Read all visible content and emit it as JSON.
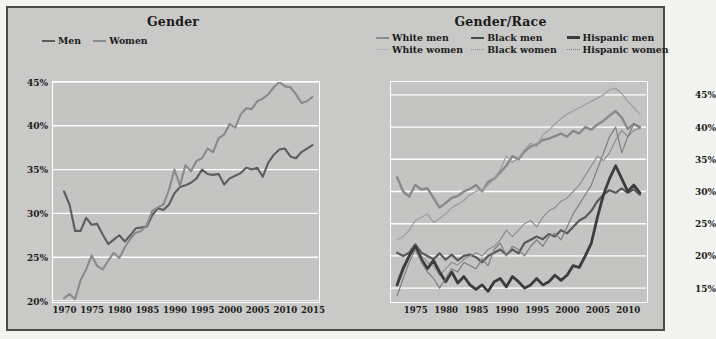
{
  "figure": {
    "background_color": "#c9c9c7",
    "border_color": "#4a4a48",
    "plot_background_color": "#c4c4c2",
    "gridline_color": "#ffffff"
  },
  "panels": [
    {
      "id": "gender",
      "title": "Gender",
      "legend": [
        {
          "label": "Men",
          "style": "solid",
          "color": "#5d5d5d"
        },
        {
          "label": "Women",
          "style": "solid",
          "color": "#8a8a8a"
        }
      ],
      "yticks": [
        "20%",
        "25%",
        "30%",
        "35%",
        "40%",
        "45%"
      ],
      "xticks": [
        "1970",
        "1975",
        "1980",
        "1985",
        "1990",
        "1995",
        "2000",
        "2005",
        "2010",
        "2015"
      ]
    },
    {
      "id": "genderrace",
      "title": "Gender/Race",
      "legend": [
        {
          "label": "White men",
          "style": "solid",
          "color": "#8a8a8a"
        },
        {
          "label": "Black men",
          "style": "solid",
          "color": "#5a5a5a"
        },
        {
          "label": "Hispanic men",
          "style": "solid",
          "color": "#3c3c3c"
        },
        {
          "label": "White women",
          "style": "dotted",
          "color": "#9c9c9c"
        },
        {
          "label": "Black women",
          "style": "dotted",
          "color": "#8f8f8f"
        },
        {
          "label": "Hispanic women",
          "style": "dotted",
          "color": "#7e7e7e"
        }
      ],
      "yticks": [
        "15%",
        "20%",
        "25%",
        "30%",
        "35%",
        "40%",
        "45%"
      ],
      "xticks": [
        "1975",
        "1980",
        "1985",
        "1990",
        "1995",
        "2000",
        "2005",
        "2010"
      ]
    }
  ],
  "chart_data": [
    {
      "type": "line",
      "title": "Gender",
      "xlabel": "",
      "ylabel": "",
      "xlim": [
        1968,
        2016
      ],
      "ylim": [
        20,
        45
      ],
      "grid": true,
      "legend_position": "top-left",
      "x": [
        1970,
        1971,
        1972,
        1973,
        1974,
        1975,
        1976,
        1977,
        1978,
        1979,
        1980,
        1981,
        1982,
        1983,
        1984,
        1985,
        1986,
        1987,
        1988,
        1989,
        1990,
        1991,
        1992,
        1993,
        1994,
        1995,
        1996,
        1997,
        1998,
        1999,
        2000,
        2001,
        2002,
        2003,
        2004,
        2005,
        2006,
        2007,
        2008,
        2009,
        2010,
        2011,
        2012,
        2013,
        2014,
        2015
      ],
      "series": [
        {
          "name": "Men",
          "style": "solid",
          "color": "#5d5d5d",
          "values": [
            32.5,
            31.0,
            28.0,
            28.0,
            29.5,
            28.7,
            28.8,
            27.6,
            26.5,
            27.0,
            27.5,
            26.8,
            27.5,
            28.3,
            28.4,
            28.5,
            29.8,
            30.6,
            30.4,
            31.0,
            32.3,
            33.0,
            33.2,
            33.5,
            34.0,
            35.0,
            34.5,
            34.4,
            34.5,
            33.3,
            34.0,
            34.3,
            34.6,
            35.2,
            35.0,
            35.2,
            34.2,
            35.8,
            36.7,
            37.3,
            37.4,
            36.5,
            36.3,
            37.0,
            37.4,
            37.8
          ]
        },
        {
          "name": "Women",
          "style": "solid",
          "color": "#8a8a8a",
          "values": [
            20.3,
            20.8,
            20.2,
            22.4,
            23.6,
            25.2,
            24.0,
            23.6,
            24.6,
            25.5,
            24.9,
            26.1,
            27.1,
            27.8,
            28.0,
            28.7,
            30.3,
            30.7,
            31.0,
            32.7,
            35.0,
            33.2,
            35.5,
            34.8,
            36.0,
            36.3,
            37.4,
            37.0,
            38.6,
            39.0,
            40.2,
            39.8,
            41.3,
            42.0,
            41.9,
            42.8,
            43.1,
            43.6,
            44.4,
            45.0,
            44.5,
            44.4,
            43.6,
            42.6,
            42.8,
            43.3
          ]
        }
      ]
    },
    {
      "type": "line",
      "title": "Gender/Race",
      "xlabel": "",
      "ylabel": "",
      "xlim": [
        1971,
        2013
      ],
      "ylim": [
        13,
        47
      ],
      "grid": true,
      "legend_position": "top",
      "x": [
        1972,
        1973,
        1974,
        1975,
        1976,
        1977,
        1978,
        1979,
        1980,
        1981,
        1982,
        1983,
        1984,
        1985,
        1986,
        1987,
        1988,
        1989,
        1990,
        1991,
        1992,
        1993,
        1994,
        1995,
        1996,
        1997,
        1998,
        1999,
        2000,
        2001,
        2002,
        2003,
        2004,
        2005,
        2006,
        2007,
        2008,
        2009,
        2010,
        2011,
        2012
      ],
      "series": [
        {
          "name": "White men",
          "style": "solid",
          "color": "#8a8a8a",
          "values": [
            32.2,
            30.0,
            29.2,
            31.0,
            30.3,
            30.5,
            29.0,
            27.5,
            28.2,
            29.0,
            29.3,
            30.0,
            30.4,
            31.0,
            30.0,
            31.5,
            32.0,
            33.0,
            34.0,
            35.5,
            35.0,
            36.2,
            37.0,
            37.3,
            38.0,
            38.2,
            38.6,
            39.0,
            38.5,
            39.4,
            39.0,
            40.0,
            39.6,
            40.4,
            41.0,
            41.8,
            42.5,
            41.5,
            39.7,
            40.5,
            40.0
          ]
        },
        {
          "name": "White women",
          "style": "dotted",
          "color": "#9c9c9c",
          "values": [
            22.5,
            23.0,
            24.0,
            25.5,
            26.0,
            26.5,
            25.2,
            25.8,
            26.5,
            27.5,
            28.0,
            28.6,
            29.5,
            30.0,
            30.2,
            31.0,
            32.0,
            33.4,
            35.5,
            34.5,
            35.2,
            36.5,
            37.5,
            37.0,
            38.8,
            39.5,
            40.5,
            41.3,
            42.0,
            42.5,
            43.0,
            43.5,
            44.0,
            44.5,
            45.0,
            45.8,
            46.0,
            45.2,
            44.0,
            43.0,
            42.0
          ]
        },
        {
          "name": "Black men",
          "style": "solid",
          "color": "#5a5a5a",
          "values": [
            20.5,
            20.0,
            20.5,
            21.8,
            20.5,
            20.0,
            19.5,
            20.4,
            19.4,
            20.2,
            19.3,
            20.0,
            20.2,
            19.8,
            19.0,
            20.0,
            20.5,
            21.0,
            20.2,
            21.0,
            20.4,
            22.0,
            22.5,
            23.0,
            22.6,
            23.4,
            23.0,
            24.0,
            23.5,
            24.5,
            25.5,
            26.0,
            27.0,
            28.5,
            29.5,
            30.2,
            29.8,
            30.5,
            29.8,
            30.3,
            29.5
          ]
        },
        {
          "name": "Black women",
          "style": "dotted",
          "color": "#8f8f8f",
          "values": [
            16.0,
            18.5,
            20.0,
            21.5,
            20.0,
            19.0,
            18.5,
            17.0,
            18.0,
            19.0,
            18.6,
            19.5,
            20.0,
            20.5,
            20.0,
            21.0,
            21.5,
            22.5,
            24.0,
            23.0,
            24.0,
            25.0,
            25.5,
            24.5,
            26.0,
            27.0,
            27.5,
            28.5,
            29.0,
            30.0,
            31.0,
            32.5,
            34.0,
            35.5,
            34.8,
            36.0,
            38.0,
            39.5,
            38.5,
            39.5,
            39.8
          ]
        },
        {
          "name": "Hispanic men",
          "style": "solid",
          "color": "#3c3c3c",
          "values": [
            15.5,
            18.0,
            20.0,
            21.5,
            19.5,
            18.0,
            19.3,
            17.5,
            16.0,
            17.5,
            15.8,
            16.8,
            15.5,
            14.8,
            15.5,
            14.5,
            16.0,
            16.5,
            15.2,
            16.8,
            16.0,
            15.0,
            15.5,
            16.5,
            15.5,
            16.0,
            17.0,
            16.2,
            17.0,
            18.5,
            18.2,
            20.0,
            22.0,
            26.0,
            29.5,
            32.0,
            34.0,
            32.0,
            30.0,
            31.0,
            29.8
          ]
        },
        {
          "name": "Hispanic women",
          "style": "dotted",
          "color": "#7e7e7e",
          "values": [
            13.8,
            16.5,
            19.0,
            21.0,
            19.0,
            17.5,
            16.5,
            15.0,
            16.5,
            18.0,
            17.5,
            19.0,
            18.5,
            18.0,
            19.5,
            18.5,
            21.0,
            22.0,
            20.0,
            21.5,
            21.0,
            20.0,
            21.5,
            22.5,
            21.5,
            23.0,
            23.5,
            22.5,
            24.5,
            26.5,
            28.0,
            29.5,
            31.0,
            33.5,
            36.0,
            38.5,
            40.0,
            36.0,
            38.5,
            40.5,
            39.8
          ]
        }
      ]
    }
  ]
}
